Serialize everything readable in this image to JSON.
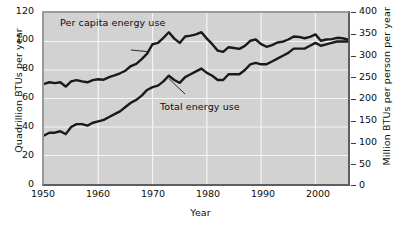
{
  "chart_data": {
    "type": "line",
    "title": "",
    "xlabel": "Year",
    "ylabel": "Quadrillion BTUs per year",
    "y2label": "Million BTUs per person per year",
    "xlim": [
      1950,
      2006
    ],
    "ylim": [
      0,
      120
    ],
    "y2lim": [
      0,
      400
    ],
    "grid": true,
    "legend_position": "inline-annotations",
    "x_ticks": [
      1950,
      1960,
      1970,
      1980,
      1990,
      2000
    ],
    "y_ticks": [
      0,
      20,
      40,
      60,
      80,
      100,
      120
    ],
    "y2_ticks": [
      0,
      50,
      100,
      150,
      200,
      250,
      300,
      350,
      400
    ],
    "annotations": [
      {
        "text": "Per capita energy use",
        "points_to_series": "Per capita energy use"
      },
      {
        "text": "Total energy use",
        "points_to_series": "Total energy use"
      }
    ],
    "x": [
      1950,
      1951,
      1952,
      1953,
      1954,
      1955,
      1956,
      1957,
      1958,
      1959,
      1960,
      1961,
      1962,
      1963,
      1964,
      1965,
      1966,
      1967,
      1968,
      1969,
      1970,
      1971,
      1972,
      1973,
      1974,
      1975,
      1976,
      1977,
      1978,
      1979,
      1980,
      1981,
      1982,
      1983,
      1984,
      1985,
      1986,
      1987,
      1988,
      1989,
      1990,
      1991,
      1992,
      1993,
      1994,
      1995,
      1996,
      1997,
      1998,
      1999,
      2000,
      2001,
      2002,
      2003,
      2004,
      2005,
      2006
    ],
    "series": [
      {
        "name": "Per capita energy use",
        "axis": "right",
        "units": "Million BTUs per person per year",
        "values": [
          234,
          238,
          236,
          238,
          228,
          240,
          243,
          240,
          238,
          243,
          245,
          244,
          250,
          254,
          259,
          265,
          276,
          281,
          292,
          305,
          327,
          330,
          342,
          355,
          340,
          330,
          345,
          347,
          350,
          355,
          340,
          327,
          312,
          309,
          320,
          318,
          316,
          323,
          335,
          338,
          327,
          321,
          325,
          331,
          333,
          338,
          345,
          344,
          341,
          344,
          350,
          335,
          338,
          339,
          342,
          341,
          338
        ]
      },
      {
        "name": "Total energy use",
        "axis": "left",
        "units": "Quadrillion BTUs per year",
        "values": [
          34,
          36,
          36,
          37,
          35,
          40,
          42,
          42,
          41,
          43,
          44,
          45,
          47,
          49,
          51,
          54,
          57,
          59,
          62,
          66,
          68,
          69,
          72,
          76,
          73,
          71,
          75,
          77,
          79,
          81,
          78,
          76,
          73,
          73,
          77,
          77,
          77,
          80,
          84,
          85,
          84,
          84,
          86,
          88,
          90,
          92,
          95,
          95,
          95,
          97,
          99,
          97,
          98,
          99,
          100,
          100,
          100
        ]
      }
    ]
  },
  "axes": {
    "left": {
      "title": "Quadrillion BTUs per year",
      "labels": [
        "120",
        "100",
        "80",
        "60",
        "40",
        "20",
        "0"
      ]
    },
    "right": {
      "title": "Million BTUs per person per year",
      "labels": [
        "400",
        "350",
        "300",
        "250",
        "200",
        "150",
        "100",
        "50",
        "0"
      ]
    },
    "bottom": {
      "title": "Year",
      "labels": [
        "1950",
        "1960",
        "1970",
        "1980",
        "1990",
        "2000"
      ]
    }
  },
  "annotations": {
    "per_capita": "Per capita energy use",
    "total": "Total energy use"
  },
  "colors": {
    "plot_background": "#d2d2d2",
    "gridline": "#f4f4f4",
    "series_line": "#1a1a1a",
    "text": "#0d0d0d",
    "frame_dark": "#5e5e5e",
    "frame_light": "#9a9a9a"
  }
}
